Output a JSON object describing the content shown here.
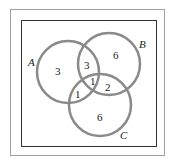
{
  "diagram": {
    "type": "venn-3-set",
    "sets": [
      {
        "name": "A",
        "label": "A"
      },
      {
        "name": "B",
        "label": "B"
      },
      {
        "name": "C",
        "label": "C"
      }
    ],
    "regions": {
      "A_only": "3",
      "B_only": "6",
      "C_only": "6",
      "A_and_B_only": "3",
      "A_and_C_only": "1",
      "B_and_C_only": "2",
      "A_and_B_and_C": "1"
    },
    "colors": {
      "circle_stroke": "#8a8a8a",
      "inner_frame": "#333333",
      "outer_frame": "#9a9a9a"
    }
  }
}
